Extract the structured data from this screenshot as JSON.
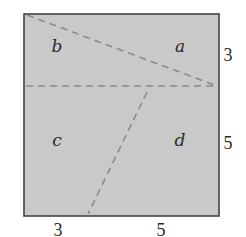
{
  "diagram": {
    "type": "square-dissection",
    "colors": {
      "fill": "#c9c9c9",
      "border": "#444444",
      "dashed_line": "#8a8a8a",
      "text": "#2a2a2a"
    },
    "square": {
      "x": 24,
      "y": 14,
      "width": 195,
      "height": 202
    },
    "lines": [
      {
        "name": "diagonal-top",
        "x1": 27,
        "y1": 15,
        "x2": 217,
        "y2": 86
      },
      {
        "name": "horizontal-middle",
        "x1": 26,
        "y1": 86,
        "x2": 217,
        "y2": 86
      },
      {
        "name": "slanted-bottom",
        "x1": 147,
        "y1": 92,
        "x2": 88,
        "y2": 214
      }
    ],
    "regions": [
      {
        "label": "b",
        "x": 57,
        "y": 52
      },
      {
        "label": "a",
        "x": 180,
        "y": 52
      },
      {
        "label": "c",
        "x": 57,
        "y": 146
      },
      {
        "label": "d",
        "x": 180,
        "y": 146
      }
    ],
    "dimensions": {
      "right": [
        {
          "label": "3",
          "x": 228,
          "y": 61
        },
        {
          "label": "5",
          "x": 228,
          "y": 149
        }
      ],
      "bottom": [
        {
          "label": "3",
          "x": 58,
          "y": 236
        },
        {
          "label": "5",
          "x": 161,
          "y": 236
        }
      ]
    }
  }
}
